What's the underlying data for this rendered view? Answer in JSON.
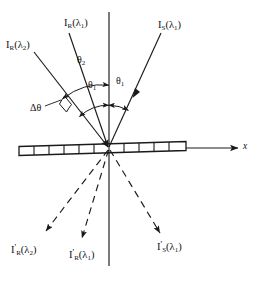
{
  "figure": {
    "background_color": "#ffffff",
    "line_color": "#1a1a1a"
  },
  "axes": {
    "x_axis_label": "x",
    "vertical_axis_label": ""
  },
  "incident_rays": [
    {
      "id": "I_R_lambda2",
      "symbol": "I",
      "subscript": "R",
      "argument": "(λ",
      "argument_sub": "2",
      "argument_close": ")",
      "label_plain": "I R (λ2)"
    },
    {
      "id": "I_R_lambda1",
      "symbol": "I",
      "subscript": "R",
      "argument": "(λ",
      "argument_sub": "1",
      "argument_close": ")",
      "label_plain": "I R (λ1)"
    },
    {
      "id": "I_S_lambda1",
      "symbol": "I",
      "subscript": "S",
      "argument": "(λ",
      "argument_sub": "1",
      "argument_close": ")",
      "label_plain": "I S (λ1)"
    }
  ],
  "transmitted_rays": [
    {
      "id": "I_R_prime_lambda2",
      "symbol": "I",
      "prime": "'",
      "subscript": "R",
      "argument": "(λ",
      "argument_sub": "2",
      "argument_close": ")",
      "label_plain": "I'R (λ2)"
    },
    {
      "id": "I_R_prime_lambda1",
      "symbol": "I",
      "prime": "'",
      "subscript": "R",
      "argument": "(λ",
      "argument_sub": "1",
      "argument_close": ")",
      "label_plain": "I'R (λ1)"
    },
    {
      "id": "I_S_prime_lambda1",
      "symbol": "I",
      "prime": "'",
      "subscript": "S",
      "argument": "(λ",
      "argument_sub": "1",
      "argument_close": ")",
      "label_plain": "I'S (λ1)"
    }
  ],
  "angles": [
    {
      "id": "theta2",
      "symbol": "θ",
      "subscript": "2",
      "label_plain": "θ2",
      "position": "upper-left"
    },
    {
      "id": "theta1_left",
      "symbol": "θ",
      "subscript": "1",
      "label_plain": "θ1",
      "position": "left-of-vertical"
    },
    {
      "id": "theta1_right",
      "symbol": "θ",
      "subscript": "1",
      "label_plain": "θ1",
      "position": "right-of-vertical"
    },
    {
      "id": "delta_theta",
      "symbol": "Δθ",
      "subscript": "",
      "label_plain": "Δθ",
      "position": "far-left"
    }
  ],
  "sample": {
    "name": "grating-slab",
    "divisions": 11
  }
}
